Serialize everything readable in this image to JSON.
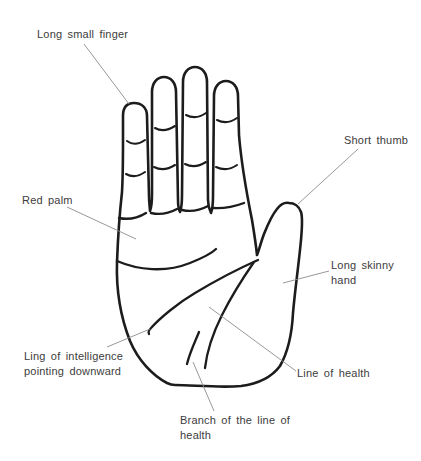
{
  "colors": {
    "background": "#ffffff",
    "outline": "#1c1c1c",
    "leader_line": "#8c8c8c",
    "label_text": "#3c3c3c"
  },
  "labels": {
    "long_small_finger": "Long small finger",
    "short_thumb": "Short thumb",
    "red_palm": "Red palm",
    "long_skinny_hand_line1": "Long skinny",
    "long_skinny_hand_line2": "hand",
    "intelligence_line1": "Ling of intelligence",
    "intelligence_line2": "pointing downward",
    "line_of_health": "Line of health",
    "branch_of_health_line1": "Branch of the line of",
    "branch_of_health_line2": "health"
  }
}
